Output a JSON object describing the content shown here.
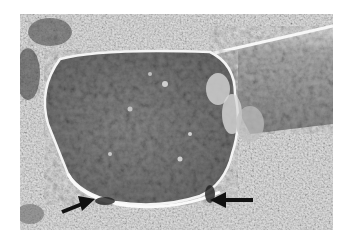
{
  "image": {
    "description": "Grayscale scanning electron micrograph of a fractured fiber/rod end with a bulbous flattened tip resting on a rough granular substrate",
    "background_color": "#ffffff",
    "palette": {
      "substrate_light": "#d9d9d9",
      "substrate_dark": "#8a8a8a",
      "tip_surface": "#7a7a7a",
      "tip_rim": "#f2f2f2",
      "rod": "#9a9a9a",
      "arrow": "#111111"
    },
    "annotations": [
      {
        "type": "arrow",
        "direction": "up-right",
        "tail": [
          62,
          212
        ],
        "head": [
          92,
          200
        ]
      },
      {
        "type": "arrow",
        "direction": "left",
        "tail": [
          253,
          200
        ],
        "head": [
          210,
          200
        ]
      }
    ]
  }
}
